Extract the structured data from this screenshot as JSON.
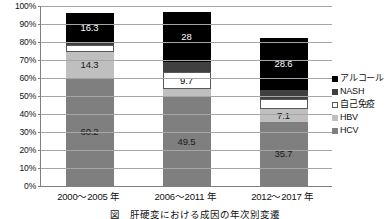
{
  "chart_data": {
    "type": "bar",
    "stacked": true,
    "stack_total": 100,
    "title": "",
    "subtitle": "",
    "xlabel": "",
    "ylabel": "",
    "ylim": [
      0,
      100
    ],
    "ytick_labels": [
      "100%",
      "90%",
      "80%",
      "70%",
      "60%",
      "50%",
      "40%",
      "30%",
      "20%",
      "10%",
      "0%"
    ],
    "ytick_values": [
      100,
      90,
      80,
      70,
      60,
      50,
      40,
      30,
      20,
      10,
      0
    ],
    "grid": true,
    "legend_position": "right",
    "categories": [
      "2000〜2005 年",
      "2006〜2011 年",
      "2012〜2017 年"
    ],
    "series": [
      {
        "name": "HCV",
        "color": "#7f7f7f",
        "values": [
          60.2,
          49.5,
          35.7
        ],
        "labels": [
          "60.2",
          "49.5",
          "35.7"
        ]
      },
      {
        "name": "HBV",
        "color": "#bfbfbf",
        "values": [
          14.3,
          4.3,
          7.1
        ],
        "labels": [
          "14.3",
          "4.3",
          "7.1"
        ]
      },
      {
        "name": "自己免疫",
        "color": "#ffffff",
        "values": [
          3.6,
          9.7,
          5.4
        ],
        "labels": [
          "3.6",
          "9.7",
          "5.4"
        ]
      },
      {
        "name": "NASH",
        "color": "#404040",
        "values": [
          1.5,
          5.4,
          5.4
        ],
        "labels": [
          "1.5",
          "5.4",
          "5.4"
        ]
      },
      {
        "name": "アルコール",
        "color": "#000000",
        "values": [
          16.3,
          28,
          28.6
        ],
        "labels": [
          "16.3",
          "28",
          "28.6"
        ]
      }
    ],
    "legend_entries": [
      {
        "label": "アルコール",
        "color": "#000000"
      },
      {
        "label": "NASH",
        "color": "#404040"
      },
      {
        "label": "自己免疫",
        "color": "#ffffff"
      },
      {
        "label": "HBV",
        "color": "#bfbfbf"
      },
      {
        "label": "HCV",
        "color": "#7f7f7f"
      }
    ]
  },
  "caption": "図　肝硬変における成因の年次別変遷"
}
